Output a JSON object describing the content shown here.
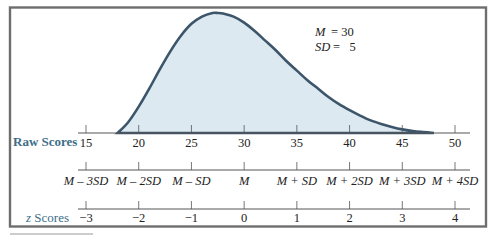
{
  "chart_data": {
    "type": "area",
    "title": "",
    "annotation": {
      "mean_label": "M",
      "mean_eq": "= 30",
      "sd_label": "SD",
      "sd_eq": "=   5"
    },
    "mean": 30,
    "sd": 5,
    "xlim": [
      15,
      50
    ],
    "curve": {
      "x": [
        18,
        19,
        20,
        21,
        22,
        23,
        24,
        25,
        26,
        27,
        27.5,
        28,
        29,
        30,
        31,
        32,
        33,
        34,
        35,
        36,
        37,
        38,
        39,
        40,
        41,
        42,
        43,
        44,
        45,
        46,
        47,
        48
      ],
      "y": [
        0.0,
        0.09,
        0.22,
        0.37,
        0.53,
        0.68,
        0.81,
        0.91,
        0.97,
        1.0,
        1.0,
        0.995,
        0.97,
        0.92,
        0.85,
        0.77,
        0.69,
        0.6,
        0.52,
        0.44,
        0.37,
        0.3,
        0.24,
        0.19,
        0.145,
        0.105,
        0.075,
        0.05,
        0.03,
        0.017,
        0.008,
        0.0
      ]
    },
    "raw_axis": {
      "label": "Raw Scores",
      "ticks": [
        15,
        20,
        25,
        30,
        35,
        40,
        45,
        50
      ],
      "tick_labels": [
        "15",
        "20",
        "25",
        "30",
        "35",
        "40",
        "45",
        "50"
      ]
    },
    "sd_axis": {
      "ticks": [
        15,
        20,
        25,
        30,
        35,
        40,
        45,
        50
      ],
      "tick_labels": [
        "M – 3SD",
        "M – 2SD",
        "M – SD",
        "M",
        "M + SD",
        "M + 2SD",
        "M + 3SD",
        "M + 4SD"
      ]
    },
    "z_axis": {
      "label": "z Scores",
      "ticks": [
        15,
        20,
        25,
        30,
        35,
        40,
        45,
        50
      ],
      "tick_labels": [
        "−3",
        "−2",
        "−1",
        "0",
        "1",
        "2",
        "3",
        "4"
      ]
    },
    "grid": false,
    "legend": "none"
  },
  "colors": {
    "curve_fill": "#dde9f0",
    "curve_stroke": "#3c556a",
    "row_label": "#3d6e88",
    "frame": "#6e6e6e"
  }
}
